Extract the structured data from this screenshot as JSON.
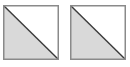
{
  "canvas": {
    "width": 130,
    "height": 67,
    "background_color": "#ffffff",
    "description": "Two identical squares side by side, each split by a diagonal from the top-left corner to the bottom-right corner"
  },
  "style": {
    "border_color": "#8a8a8a",
    "border_color_dark": "#6e6e6e",
    "border_width": 1.5,
    "diagonal_color": "#3a3a3a",
    "diagonal_width": 1.4,
    "fill_gray": "#d9d9d9",
    "fill_white": "#ffffff"
  },
  "shapes": [
    {
      "name": "square-left",
      "label": "Left square",
      "x": 3,
      "y": 5,
      "width": 56,
      "height": 55,
      "diagonal": {
        "from": "top-left",
        "to": "bottom-right"
      },
      "regions": [
        {
          "name": "lower-left-triangle",
          "fill": "#d9d9d9",
          "fill_name": "gray"
        },
        {
          "name": "upper-right-triangle",
          "fill": "#ffffff",
          "fill_name": "white"
        }
      ]
    },
    {
      "name": "square-right",
      "label": "Right square",
      "x": 70,
      "y": 5,
      "width": 56,
      "height": 55,
      "diagonal": {
        "from": "top-left",
        "to": "bottom-right"
      },
      "regions": [
        {
          "name": "lower-left-triangle",
          "fill": "#d9d9d9",
          "fill_name": "gray"
        },
        {
          "name": "upper-right-triangle",
          "fill": "#ffffff",
          "fill_name": "white"
        }
      ]
    }
  ]
}
